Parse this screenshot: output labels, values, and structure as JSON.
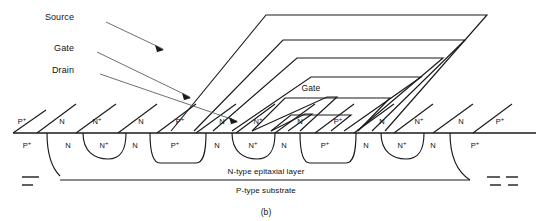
{
  "figure": {
    "caption": "(b)"
  },
  "callouts": [
    {
      "label": "Source",
      "x": 74,
      "y": 20
    },
    {
      "label": "Gate",
      "x": 74,
      "y": 50
    },
    {
      "label": "Drain",
      "x": 74,
      "y": 72
    }
  ],
  "inner_gate_label": {
    "label": "Gate",
    "x": 286,
    "y": 87
  },
  "layers": [
    {
      "label": "N-type epitaxial layer",
      "x": 237,
      "y": 171
    },
    {
      "label": "P-type substrate",
      "x": 237,
      "y": 190
    }
  ],
  "doping_top_row": {
    "y": 122,
    "labels": [
      {
        "text": "P",
        "sup": "+",
        "x": 22
      },
      {
        "text": "N",
        "sup": "",
        "x": 62
      },
      {
        "text": "N",
        "sup": "+",
        "x": 97
      },
      {
        "text": "N",
        "sup": "",
        "x": 141
      },
      {
        "text": "P",
        "sup": "+",
        "x": 180
      },
      {
        "text": "N",
        "sup": "",
        "x": 222
      },
      {
        "text": "N",
        "sup": "+",
        "x": 258
      },
      {
        "text": "N",
        "sup": "",
        "x": 300
      },
      {
        "text": "P",
        "sup": "+",
        "x": 338
      },
      {
        "text": "N",
        "sup": "",
        "x": 382
      },
      {
        "text": "N",
        "sup": "+",
        "x": 419
      },
      {
        "text": "N",
        "sup": "",
        "x": 461
      },
      {
        "text": "P",
        "sup": "+",
        "x": 500
      }
    ]
  },
  "doping_bottom_row": {
    "y": 146,
    "labels": [
      {
        "text": "P",
        "sup": "+",
        "x": 27
      },
      {
        "text": "N",
        "sup": "",
        "x": 68
      },
      {
        "text": "N",
        "sup": "+",
        "x": 104
      },
      {
        "text": "N",
        "sup": "",
        "x": 135
      },
      {
        "text": "P",
        "sup": "+",
        "x": 175
      },
      {
        "text": "N",
        "sup": "",
        "x": 217
      },
      {
        "text": "N",
        "sup": "+",
        "x": 253
      },
      {
        "text": "N",
        "sup": "",
        "x": 284
      },
      {
        "text": "P",
        "sup": "+",
        "x": 325
      },
      {
        "text": "N",
        "sup": "",
        "x": 366
      },
      {
        "text": "N",
        "sup": "+",
        "x": 402
      },
      {
        "text": "N",
        "sup": "",
        "x": 433
      },
      {
        "text": "P",
        "sup": "+",
        "x": 475
      }
    ]
  },
  "geometry": {
    "surface_line": {
      "x1": 13,
      "y1": 133,
      "x2": 536,
      "y2": 133
    },
    "epi_substrate_line": {
      "x1": 22,
      "y1": 180,
      "x2": 518,
      "y2": 180
    },
    "chevrons": [
      {
        "apex_x": 487,
        "top_y": 15,
        "left_x": 171,
        "left_y": 131
      },
      {
        "apex_x": 465,
        "top_y": 40,
        "left_x": 194,
        "left_y": 131
      },
      {
        "apex_x": 443,
        "top_y": 58,
        "left_x": 213,
        "left_y": 131
      },
      {
        "apex_x": 421,
        "top_y": 77,
        "left_x": 232,
        "left_y": 131
      },
      {
        "apex_x": 337,
        "top_y": 97,
        "left_x": 252,
        "left_y": 131
      },
      {
        "apex_x": 312,
        "top_y": 114,
        "left_x": 271,
        "left_y": 131
      }
    ],
    "stripe_diagonals_x": [
      13,
      37,
      76,
      118,
      157,
      196,
      236,
      275,
      315,
      354,
      394,
      433,
      473
    ],
    "wells_top_x": [
      97,
      258,
      419
    ],
    "wells_bottom_x": [
      104,
      253,
      402
    ],
    "colors": {
      "line": "#1a1a1a",
      "thin": "#555555",
      "background": "#ffffff"
    }
  }
}
